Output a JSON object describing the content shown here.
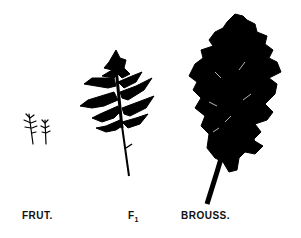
{
  "figure": {
    "labels": {
      "frut": "FRUT.",
      "f1_base": "F",
      "f1_sub": "1",
      "brouss": "BROUSS."
    },
    "ink_color": "#000000",
    "background": "#ffffff"
  }
}
